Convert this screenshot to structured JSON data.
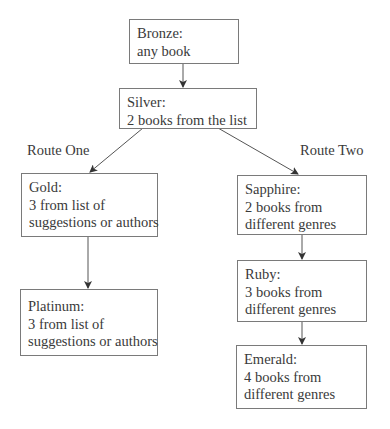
{
  "diagram": {
    "type": "flowchart",
    "nodes": [
      {
        "id": "bronze",
        "title": "Bronze:",
        "lines": [
          "any book"
        ]
      },
      {
        "id": "silver",
        "title": "Silver:",
        "lines": [
          "2 books from the list"
        ]
      },
      {
        "id": "gold",
        "title": "Gold:",
        "lines": [
          "3 from list of",
          "suggestions or authors"
        ]
      },
      {
        "id": "platinum",
        "title": "Platinum:",
        "lines": [
          "3 from list of",
          "suggestions or authors"
        ]
      },
      {
        "id": "sapphire",
        "title": "Sapphire:",
        "lines": [
          "2 books from",
          "different genres"
        ]
      },
      {
        "id": "ruby",
        "title": "Ruby:",
        "lines": [
          "3 books from",
          "different genres"
        ]
      },
      {
        "id": "emerald",
        "title": "Emerald:",
        "lines": [
          "4 books from",
          "different genres"
        ]
      }
    ],
    "edges": [
      {
        "from": "bronze",
        "to": "silver"
      },
      {
        "from": "silver",
        "to": "gold",
        "label": "Route One"
      },
      {
        "from": "silver",
        "to": "sapphire",
        "label": "Route Two"
      },
      {
        "from": "gold",
        "to": "platinum"
      },
      {
        "from": "sapphire",
        "to": "ruby"
      },
      {
        "from": "ruby",
        "to": "emerald"
      }
    ],
    "route_labels": {
      "left": "Route One",
      "right": "Route Two"
    }
  }
}
